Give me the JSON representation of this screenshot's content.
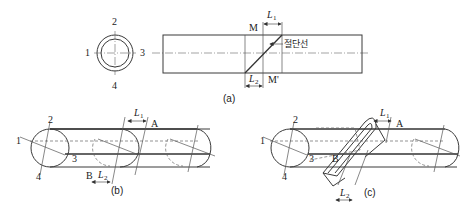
{
  "panel_a": {
    "caption": "(a)",
    "section_labels": [
      "1",
      "2",
      "3",
      "4"
    ],
    "top_label": "M",
    "bottom_label": "M'",
    "dim_top": "L",
    "dim_top_sub": "1",
    "dim_bottom": "L",
    "dim_bottom_sub": "2",
    "cut_line_label": "절단선"
  },
  "panel_b": {
    "caption": "(b)",
    "labels": [
      "1",
      "2",
      "3",
      "4"
    ],
    "point_a": "A",
    "point_b": "B",
    "dim_top": "L",
    "dim_top_sub": "1",
    "dim_bottom": "L",
    "dim_bottom_sub": "2"
  },
  "panel_c": {
    "caption": "(c)",
    "labels": [
      "1",
      "2",
      "3",
      "4"
    ],
    "point_a": "A",
    "point_b": "B",
    "dim_top": "L",
    "dim_top_sub": "1",
    "dim_bottom": "L",
    "dim_bottom_sub": "2"
  }
}
